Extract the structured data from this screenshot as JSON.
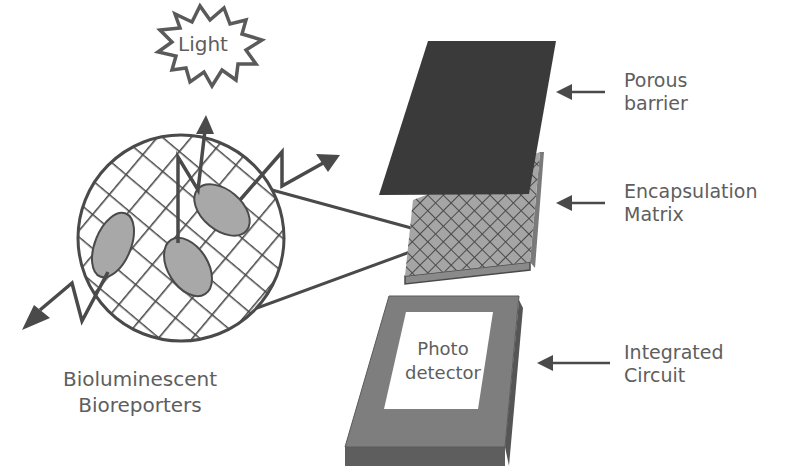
{
  "diagram": {
    "type": "bioreporter-sensor-schematic",
    "colors": {
      "stroke": "#4a4a4a",
      "text": "#5e5e5e",
      "cell_fill": "#a8a8a8",
      "barrier_fill": "#3a3a3a",
      "matrix_fill": "#9a9a9a",
      "circuit_fill": "#7a7a7a",
      "detector_fill": "#ffffff",
      "background": "#ffffff"
    },
    "burst": {
      "label": "Light"
    },
    "bioreporters": {
      "line1": "Bioluminescent",
      "line2": "Bioreporters"
    },
    "photodetector": {
      "line1": "Photo",
      "line2": "detector"
    },
    "layers": [
      {
        "id": "porous-barrier",
        "line1": "Porous",
        "line2": "barrier"
      },
      {
        "id": "encapsulation-matrix",
        "line1": "Encapsulation",
        "line2": "Matrix"
      },
      {
        "id": "integrated-circuit",
        "line1": "Integrated",
        "line2": "Circuit"
      }
    ]
  }
}
